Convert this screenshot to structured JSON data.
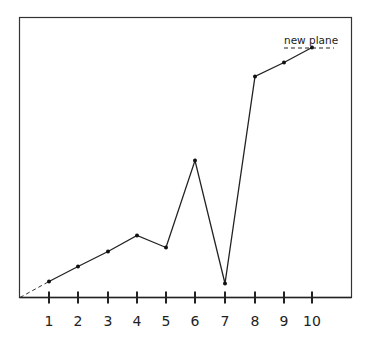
{
  "chart_data": {
    "type": "line",
    "title": "",
    "xlabel": "",
    "ylabel": "",
    "categories": [
      "1",
      "2",
      "3",
      "4",
      "5",
      "6",
      "7",
      "8",
      "9",
      "10"
    ],
    "x": [
      1,
      2,
      3,
      4,
      5,
      6,
      7,
      8,
      9,
      10
    ],
    "series": [
      {
        "name": "line",
        "values": [
          16,
          31,
          46,
          62,
          50,
          137,
          14,
          221,
          235,
          250
        ],
        "value_note": "relative heights above the x-axis (no y scale shown)"
      }
    ],
    "origin_extension": "dashed segment from origin to point 1",
    "annotations": [
      {
        "text": "new plane",
        "near_x": 10,
        "style": "dashed horizontal reference line beneath label"
      }
    ],
    "ylim": [
      0,
      280
    ],
    "grid": false,
    "legend": "none",
    "y_ticks_shown": false
  },
  "labels": {
    "ticks": [
      "1",
      "2",
      "3",
      "4",
      "5",
      "6",
      "7",
      "8",
      "9",
      "10"
    ],
    "annotation": "new plane"
  }
}
